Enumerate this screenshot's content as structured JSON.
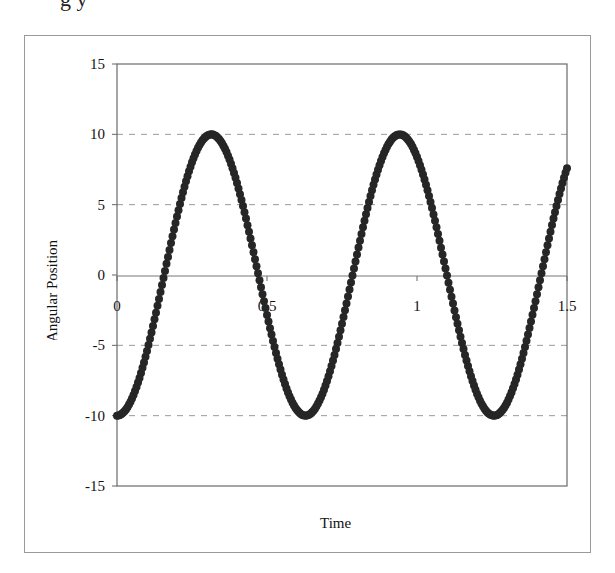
{
  "header": {
    "clipped_title": "g     y"
  },
  "chart_data": {
    "type": "scatter",
    "title": "",
    "xlabel": "Time",
    "ylabel": "Angular Position",
    "xlim": [
      0,
      1.5
    ],
    "ylim": [
      -15,
      15
    ],
    "xticks": [
      "0",
      "0.5",
      "1",
      "1.5"
    ],
    "yticks": [
      "15",
      "10",
      "5",
      "0",
      "-5",
      "-10",
      "-15"
    ],
    "grid": {
      "horizontal_dashed": [
        10,
        5,
        -5,
        -10
      ]
    },
    "legend": null,
    "series": [
      {
        "name": "Angular Position",
        "marker": "circle",
        "color": "#262626",
        "approximate_formula": "y = -10*cos(10*t)",
        "t_step": 0.005,
        "note": "Approximated from the visual, not transcribed point-by-point. Peaks and troughs match the model, but the plotted end value near t=1.5 reads about 6.7 while the formula gives about 7.6.",
        "key_points": [
          {
            "x": 0,
            "y": -10
          },
          {
            "x": 0.157,
            "y": 0
          },
          {
            "x": 0.314,
            "y": 10
          },
          {
            "x": 0.471,
            "y": 0
          },
          {
            "x": 0.628,
            "y": -10
          },
          {
            "x": 0.785,
            "y": 0
          },
          {
            "x": 0.942,
            "y": 10
          },
          {
            "x": 1.1,
            "y": 0
          },
          {
            "x": 1.257,
            "y": -10
          },
          {
            "x": 1.414,
            "y": 0
          },
          {
            "x": 1.5,
            "y": 6.7
          }
        ]
      }
    ]
  }
}
